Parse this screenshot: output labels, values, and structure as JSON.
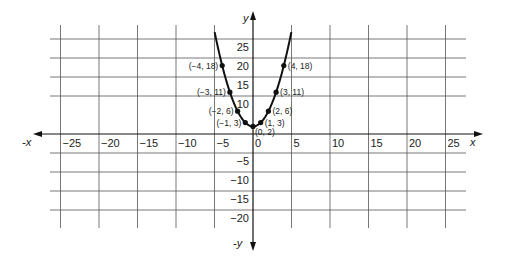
{
  "chart_data": {
    "type": "line",
    "title": "",
    "function": "y = x^2 + 2",
    "xlabel": "x",
    "xlabel_negative": "-x",
    "ylabel": "y",
    "ylabel_negative": "-y",
    "xlim": [
      -27,
      27
    ],
    "ylim": [
      -24,
      29
    ],
    "grid": true,
    "legend": null,
    "x_ticks": [
      -25,
      -20,
      -15,
      -10,
      -5,
      0,
      5,
      10,
      15,
      20,
      25
    ],
    "x_tick_labels": [
      "−25",
      "−20",
      "−15",
      "−10",
      "−5",
      "0",
      "5",
      "10",
      "15",
      "20",
      "25"
    ],
    "y_ticks": [
      25,
      20,
      15,
      10,
      -5,
      -10,
      -15,
      -20
    ],
    "y_tick_labels": [
      "25",
      "20",
      "15",
      "10",
      "−5",
      "−10",
      "−15",
      "−20"
    ],
    "series": [
      {
        "name": "y = x^2 + 2",
        "x": [
          -4,
          -3,
          -2,
          -1,
          0,
          1,
          2,
          3,
          4
        ],
        "y": [
          18,
          11,
          6,
          3,
          2,
          3,
          6,
          11,
          18
        ]
      }
    ],
    "point_labels": [
      "(−4, 18)",
      "(−3, 11)",
      "(−2, 6)",
      "(−1, 3)",
      "(0, 2)",
      "(1, 3)",
      "(2, 6)",
      "(3, 11)",
      "(4, 18)"
    ],
    "colors": {
      "line": "#111111",
      "grid": "#555555",
      "axis": "#111111",
      "background": "#ffffff"
    }
  }
}
